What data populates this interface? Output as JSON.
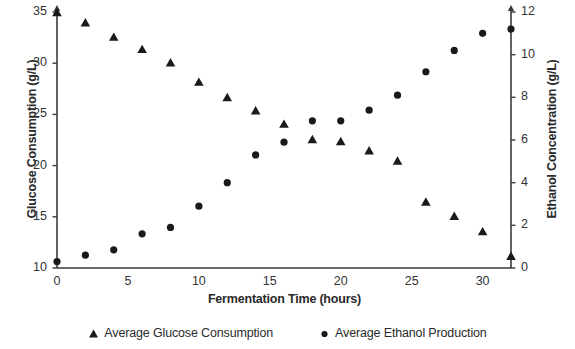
{
  "chart_data": {
    "type": "scatter",
    "title": "",
    "xlabel": "Fermentation Time (hours)",
    "ylabel": "Glucose Consumption (g/L)",
    "y2label": "Ethanol Concentration (g/L)",
    "xlim": [
      0,
      32
    ],
    "ylim": [
      10,
      35
    ],
    "y2lim": [
      0,
      12
    ],
    "grid": false,
    "legend_position": "bottom",
    "x_ticks": [
      0,
      5,
      10,
      15,
      20,
      25,
      30
    ],
    "x_tick_labels": [
      "0",
      "5",
      "10",
      "15",
      "20",
      "25",
      "30"
    ],
    "y_ticks": [
      10,
      15,
      20,
      25,
      30,
      35
    ],
    "y_tick_labels": [
      "10",
      "15",
      "20",
      "25",
      "30",
      "35"
    ],
    "y2_ticks": [
      0,
      2,
      4,
      6,
      8,
      10,
      12
    ],
    "y2_tick_labels": [
      "0",
      "2",
      "4",
      "6",
      "8",
      "10",
      "12"
    ],
    "x": [
      0,
      2,
      4,
      6,
      8,
      10,
      12,
      14,
      16,
      18,
      20,
      22,
      24,
      26,
      28,
      30,
      32
    ],
    "series": [
      {
        "name": "Average Glucose Consumption",
        "marker": "triangle",
        "axis": "left",
        "color": "#1a1a1a",
        "values": [
          35.0,
          34.0,
          32.6,
          31.4,
          30.1,
          28.2,
          26.7,
          25.4,
          24.1,
          22.6,
          22.4,
          21.5,
          20.5,
          16.5,
          15.1,
          13.6,
          11.2
        ]
      },
      {
        "name": "Average Ethanol Production",
        "marker": "circle",
        "axis": "right",
        "color": "#1a1a1a",
        "values": [
          0.3,
          0.6,
          0.85,
          1.6,
          1.9,
          2.9,
          4.0,
          5.3,
          5.9,
          6.9,
          6.9,
          7.4,
          8.1,
          9.2,
          10.2,
          11.0,
          11.2
        ]
      }
    ]
  },
  "legend": {
    "entries": [
      {
        "label": "Average Glucose Consumption",
        "marker": "triangle-marker-icon"
      },
      {
        "label": "Average Ethanol Production",
        "marker": "circle-marker-icon"
      }
    ]
  },
  "axes": {
    "x_title": "Fermentation Time (hours)",
    "y_left_title": "Glucose Consumption (g/L)",
    "y_right_title": "Ethanol Concentration (g/L)"
  }
}
